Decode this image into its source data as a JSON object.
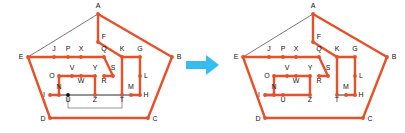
{
  "figure": {
    "type": "diagram",
    "arrow_icon": "right-arrow-icon",
    "arrow_color": "#36bdf0",
    "background_color": "#ffffff",
    "edge_color_active": "#e8502a",
    "edge_color_inactive": "#555555",
    "vertex_color_on": "#e8502a",
    "vertex_color_off": "#111111",
    "label_color": "#111111"
  },
  "vertices": {
    "A": {
      "x": 98,
      "y": 14,
      "label": "A",
      "lx": 98,
      "ly": 8
    },
    "B": {
      "x": 172,
      "y": 57,
      "label": "B",
      "lx": 179,
      "ly": 59
    },
    "C": {
      "x": 148,
      "y": 118,
      "label": "C",
      "lx": 155,
      "ly": 121
    },
    "D": {
      "x": 50,
      "y": 118,
      "label": "D",
      "lx": 43,
      "ly": 121
    },
    "E": {
      "x": 28,
      "y": 57,
      "label": "E",
      "lx": 21,
      "ly": 59
    },
    "F": {
      "x": 98,
      "y": 42,
      "label": "F",
      "lx": 104,
      "ly": 39
    },
    "G": {
      "x": 140,
      "y": 57,
      "label": "G",
      "lx": 140,
      "ly": 51
    },
    "H": {
      "x": 140,
      "y": 95,
      "label": "H",
      "lx": 146,
      "ly": 97
    },
    "I": {
      "x": 50,
      "y": 95,
      "label": "I",
      "lx": 44,
      "ly": 97
    },
    "J": {
      "x": 54,
      "y": 57,
      "label": "J",
      "lx": 54,
      "ly": 51
    },
    "K": {
      "x": 122,
      "y": 57,
      "label": "K",
      "lx": 122,
      "ly": 51
    },
    "L": {
      "x": 140,
      "y": 76,
      "label": "L",
      "lx": 146,
      "ly": 78
    },
    "M": {
      "x": 131,
      "y": 95,
      "label": "M",
      "lx": 131,
      "ly": 89
    },
    "N": {
      "x": 59,
      "y": 95,
      "label": "N",
      "lx": 59,
      "ly": 89
    },
    "O": {
      "x": 59,
      "y": 76,
      "label": "O",
      "lx": 52,
      "ly": 78
    },
    "P": {
      "x": 68,
      "y": 57,
      "label": "P",
      "lx": 68,
      "ly": 51
    },
    "Q": {
      "x": 104,
      "y": 57,
      "label": "Q",
      "lx": 104,
      "ly": 51
    },
    "R": {
      "x": 104,
      "y": 76,
      "label": "R",
      "lx": 104,
      "ly": 83
    },
    "S": {
      "x": 113,
      "y": 76,
      "label": "S",
      "lx": 113,
      "ly": 70
    },
    "T": {
      "x": 122,
      "y": 95,
      "label": "T",
      "lx": 122,
      "ly": 102
    },
    "U": {
      "x": 68,
      "y": 95,
      "label": "U",
      "lx": 68,
      "ly": 102
    },
    "V": {
      "x": 72,
      "y": 76,
      "label": "V",
      "lx": 72,
      "ly": 70
    },
    "W": {
      "x": 81,
      "y": 76,
      "label": "W",
      "lx": 81,
      "ly": 83
    },
    "X": {
      "x": 81,
      "y": 57,
      "label": "X",
      "lx": 81,
      "ly": 51
    },
    "Y": {
      "x": 95,
      "y": 76,
      "label": "Y",
      "lx": 95,
      "ly": 70
    },
    "Z": {
      "x": 95,
      "y": 95,
      "label": "Z",
      "lx": 95,
      "ly": 102
    }
  },
  "left_diagram": {
    "name": "before-diagram",
    "thin_edges": [
      [
        "E",
        "A"
      ]
    ],
    "thick_edges": [
      [
        "A",
        "F"
      ],
      [
        "A",
        "B"
      ],
      [
        "B",
        "C"
      ],
      [
        "C",
        "D"
      ],
      [
        "D",
        "E"
      ],
      [
        "E",
        "J"
      ],
      [
        "J",
        "P"
      ],
      [
        "P",
        "X"
      ],
      [
        "X",
        "Q"
      ],
      [
        "F",
        "K"
      ],
      [
        "K",
        "G"
      ],
      [
        "Q",
        "S"
      ],
      [
        "S",
        "R"
      ],
      [
        "K",
        "T"
      ],
      [
        "G",
        "L"
      ],
      [
        "L",
        "H"
      ],
      [
        "H",
        "M"
      ],
      [
        "O",
        "V"
      ],
      [
        "V",
        "W"
      ],
      [
        "W",
        "Y"
      ],
      [
        "Y",
        "Z"
      ],
      [
        "O",
        "N"
      ],
      [
        "N",
        "I"
      ]
    ],
    "gray_edges": [
      [
        "I",
        "U"
      ],
      [
        "U",
        "Z"
      ],
      [
        "Z",
        "T"
      ],
      [
        "T",
        "M"
      ]
    ],
    "gray_bracket": {
      "from_x": 68,
      "to_x": 122,
      "drop_y": 108
    },
    "hollow_vertices": [
      "U"
    ]
  },
  "right_diagram": {
    "name": "after-diagram",
    "thin_edges": [
      [
        "E",
        "A"
      ]
    ],
    "thick_edges": [
      [
        "A",
        "F"
      ],
      [
        "A",
        "B"
      ],
      [
        "B",
        "C"
      ],
      [
        "C",
        "D"
      ],
      [
        "D",
        "E"
      ],
      [
        "E",
        "J"
      ],
      [
        "J",
        "P"
      ],
      [
        "P",
        "X"
      ],
      [
        "X",
        "Q"
      ],
      [
        "F",
        "K"
      ],
      [
        "K",
        "G"
      ],
      [
        "Q",
        "S"
      ],
      [
        "S",
        "R"
      ],
      [
        "K",
        "T"
      ],
      [
        "G",
        "L"
      ],
      [
        "L",
        "H"
      ],
      [
        "H",
        "M"
      ],
      [
        "O",
        "V"
      ],
      [
        "V",
        "W"
      ],
      [
        "W",
        "Y"
      ],
      [
        "Y",
        "Z"
      ],
      [
        "O",
        "N"
      ],
      [
        "N",
        "I"
      ],
      [
        "I",
        "U"
      ],
      [
        "U",
        "Z"
      ]
    ],
    "gray_edges": [
      [
        "T",
        "M"
      ]
    ],
    "hollow_vertices": []
  }
}
